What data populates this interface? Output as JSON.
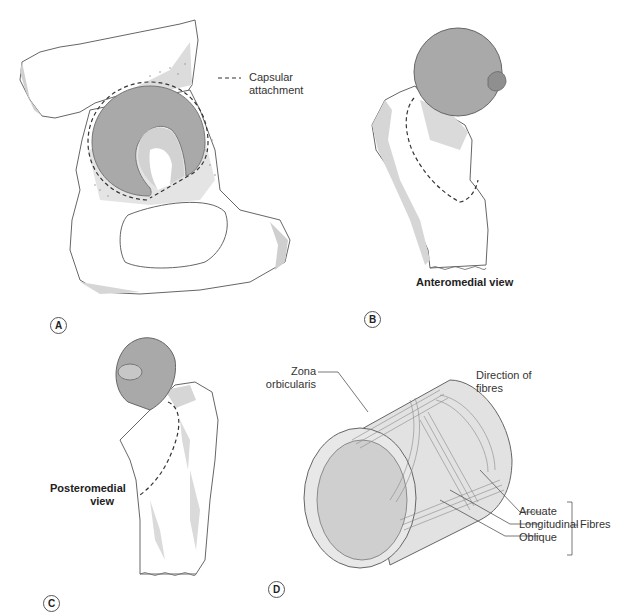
{
  "figure": {
    "colors": {
      "cartilage": "#a9a9a9",
      "bone_shade": "#d6d6d6",
      "bone_fill": "#ffffff",
      "outline": "#666666",
      "dashed_capsule": "#333333",
      "cylinder_face": "#e2e2e2",
      "cylinder_inner": "#cfcfcf"
    },
    "panels": [
      {
        "letter": "A",
        "legend": {
          "symbol": "dashed-line",
          "line1": "Capsular",
          "line2": "attachment"
        }
      },
      {
        "letter": "B",
        "caption": "Anteromedial view"
      },
      {
        "letter": "C",
        "caption_line1": "Posteromedial",
        "caption_line2": "view"
      },
      {
        "letter": "D",
        "labels": {
          "zona_line1": "Zona",
          "zona_line2": "orbicularis",
          "direction_line1": "Direction of",
          "direction_line2": "fibres",
          "arcuate": "Arcuate",
          "longitudinal": "Longitudinal",
          "oblique": "Oblique",
          "fibres_group": "Fibres"
        }
      }
    ]
  }
}
